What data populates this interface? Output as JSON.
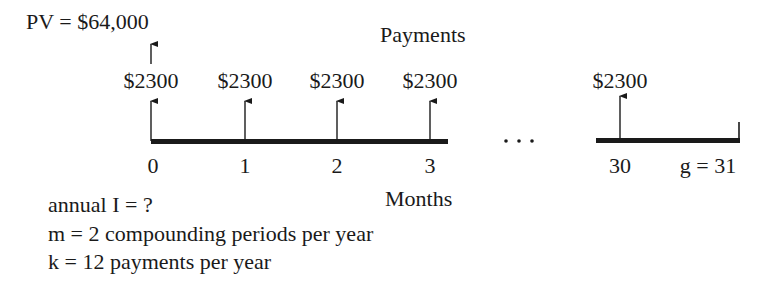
{
  "diagram": {
    "present_value_label": "PV = $64,000",
    "payments_title": "Payments",
    "axis_label": "Months",
    "ellipsis": "...",
    "payments": [
      {
        "period": "0",
        "amount": "$2300",
        "x": 151
      },
      {
        "period": "1",
        "amount": "$2300",
        "x": 245
      },
      {
        "period": "2",
        "amount": "$2300",
        "x": 337
      },
      {
        "period": "3",
        "amount": "$2300",
        "x": 430
      },
      {
        "period": "30",
        "amount": "$2300",
        "x": 620
      }
    ],
    "final_period_label": "g = 31",
    "notes": [
      "annual I = ?",
      "m = 2 compounding periods per year",
      "k = 12 payments per year"
    ],
    "line_color": "#1a1a1a"
  }
}
